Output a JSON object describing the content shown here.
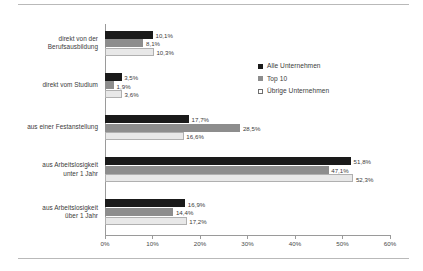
{
  "chart_data": {
    "type": "bar",
    "orientation": "horizontal",
    "title": "",
    "subtitle": "",
    "xlabel": "",
    "ylabel": "",
    "xlim": [
      0,
      60
    ],
    "xticks": [
      0,
      10,
      20,
      30,
      40,
      50,
      60
    ],
    "xtick_labels": [
      "0%",
      "10%",
      "20%",
      "30%",
      "40%",
      "50%",
      "60%"
    ],
    "grid": false,
    "legend_position": "upper right",
    "categories": [
      "direkt von der\nBerufsausbildung",
      "direkt vom Studium",
      "aus einer Festanstellung",
      "aus Arbeitslosigkeit\nunter 1 Jahr",
      "aus Arbeitslosigkeit\nüber 1 Jahr"
    ],
    "series": [
      {
        "name": "Alle Unternehmen",
        "color": "#1a1a1a",
        "values": [
          10.1,
          3.5,
          17.7,
          51.8,
          16.9
        ],
        "labels": [
          "10,1%",
          "3,5%",
          "17,7%",
          "51,8%",
          "16,9%"
        ]
      },
      {
        "name": "Top 10",
        "color": "#8d8d8d",
        "values": [
          8.1,
          1.9,
          28.5,
          47.1,
          14.4
        ],
        "labels": [
          "8,1%",
          "1,9%",
          "28,5%",
          "47,1%",
          "14,4%"
        ]
      },
      {
        "name": "Übrige Unternehmen",
        "color": "#e8e8e8",
        "values": [
          10.3,
          3.6,
          16.6,
          52.3,
          17.2
        ],
        "labels": [
          "10,3%",
          "3,6%",
          "16,6%",
          "52,3%",
          "17,2%"
        ]
      }
    ]
  },
  "legend": {
    "items": [
      {
        "label": "Alle Unternehmen"
      },
      {
        "label": "Top 10"
      },
      {
        "label": "Übrige Unternehmen"
      }
    ]
  }
}
